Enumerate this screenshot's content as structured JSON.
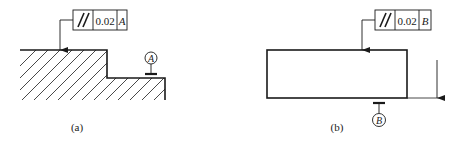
{
  "figures": [
    {
      "id": "a",
      "caption": "(a)",
      "tolerance_frame": {
        "symbol": "parallelism",
        "symbol_glyph": "//",
        "value": "0.02",
        "datum": "A"
      },
      "datum_label": "A"
    },
    {
      "id": "b",
      "caption": "(b)",
      "tolerance_frame": {
        "symbol": "parallelism",
        "symbol_glyph": "//",
        "value": "0.02",
        "datum": "B"
      },
      "datum_label": "B"
    }
  ],
  "colors": {
    "line": "#1a1a1a",
    "background": "#ffffff"
  }
}
